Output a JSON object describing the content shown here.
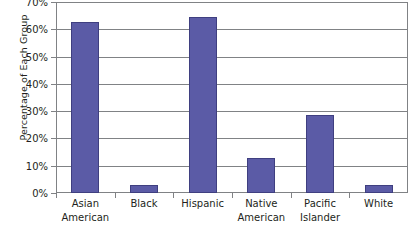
{
  "chart_data": {
    "type": "bar",
    "title": "",
    "xlabel": "",
    "ylabel": "Percentage of Each Group",
    "categories": [
      "Asian American",
      "Black",
      "Hispanic",
      "Native American",
      "Pacific Islander",
      "White"
    ],
    "category_lines": [
      [
        "Asian",
        "American"
      ],
      [
        "Black",
        ""
      ],
      [
        "Hispanic",
        ""
      ],
      [
        "Native",
        "American"
      ],
      [
        "Pacific",
        "Islander"
      ],
      [
        "White",
        ""
      ]
    ],
    "values": [
      62.5,
      3.0,
      64.5,
      13.0,
      28.5,
      3.0
    ],
    "ylim": [
      0,
      70
    ],
    "ytick_labels": [
      "0%",
      "10%",
      "20%",
      "30%",
      "40%",
      "50%",
      "60%",
      "70%"
    ],
    "ytick_values": [
      0,
      10,
      20,
      30,
      40,
      50,
      60,
      70
    ],
    "grid": true,
    "legend": "none",
    "bar_color": "#5b5ba6",
    "bar_border_color": "#3f3f80",
    "axis_color": "#808285"
  }
}
